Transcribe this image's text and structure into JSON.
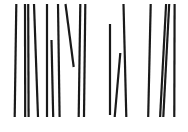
{
  "figure": {
    "background": "#ffffff",
    "stroke_color": "#1a1a1a",
    "stroke_width": 2.2,
    "lines": [
      {
        "x1": 16.3,
        "y1": 4,
        "x2": 14.7,
        "y2": 117
      },
      {
        "x1": 25,
        "y1": 4,
        "x2": 25.2,
        "y2": 117
      },
      {
        "x1": 28.2,
        "y1": 4,
        "x2": 28.6,
        "y2": 117
      },
      {
        "x1": 34,
        "y1": 4,
        "x2": 38,
        "y2": 117
      },
      {
        "x1": 47,
        "y1": 4,
        "x2": 47,
        "y2": 117
      },
      {
        "x1": 51.5,
        "y1": 40,
        "x2": 53.2,
        "y2": 117
      },
      {
        "x1": 58,
        "y1": 4,
        "x2": 59.6,
        "y2": 117
      },
      {
        "x1": 65.5,
        "y1": 4,
        "x2": 73.7,
        "y2": 67
      },
      {
        "x1": 80.3,
        "y1": 4,
        "x2": 78.7,
        "y2": 117
      },
      {
        "x1": 85.3,
        "y1": 4,
        "x2": 84,
        "y2": 117
      },
      {
        "x1": 110,
        "y1": 24,
        "x2": 110,
        "y2": 115
      },
      {
        "x1": 120.3,
        "y1": 53,
        "x2": 114.7,
        "y2": 117
      },
      {
        "x1": 123.5,
        "y1": 4,
        "x2": 126.3,
        "y2": 117
      },
      {
        "x1": 150.7,
        "y1": 4,
        "x2": 148.2,
        "y2": 117
      },
      {
        "x1": 166.1,
        "y1": 4,
        "x2": 160.1,
        "y2": 117
      },
      {
        "x1": 169.2,
        "y1": 4,
        "x2": 163.3,
        "y2": 117
      },
      {
        "x1": 174.6,
        "y1": 4,
        "x2": 174.3,
        "y2": 117
      }
    ]
  }
}
